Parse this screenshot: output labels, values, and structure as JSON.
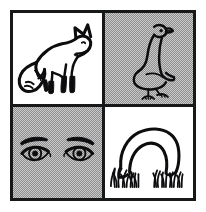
{
  "figure": {
    "kind": "line-art-panel-grid",
    "panel_count": 4,
    "columns": 2,
    "rows": 2,
    "outer_background": "#ffffff",
    "frame_color": "#17181a",
    "frame_thickness_px": 3,
    "ink_color": "#0d0d0f",
    "grey_fill": "#aeaeae",
    "white_fill": "#ffffff",
    "grey_fill_style": "halftone-dither-checkerboard"
  },
  "panels": [
    {
      "position": "top-left",
      "subject": "fox",
      "subject_label": "Fox",
      "description": "Standing fox in profile facing right with a large bushy white-tipped tail sweeping to the left, pointed ears, and dark lower legs.",
      "background": "white",
      "background_color": "#ffffff",
      "facing": "right",
      "has_grass": false
    },
    {
      "position": "top-right",
      "subject": "goose",
      "subject_label": "Goose",
      "description": "Standing goose in profile with a long S-curved neck, head turned to the right, plump body and two webbed feet.",
      "background": "grey",
      "background_color": "#aeaeae",
      "facing": "right",
      "has_grass": false
    },
    {
      "position": "bottom-left",
      "subject": "eyes",
      "subject_label": "Eyes",
      "description": "A pair of human eyes seen frontally, almond shaped with round irises and pupils, each topped by a thick arched eyebrow.",
      "background": "grey",
      "background_color": "#aeaeae",
      "facing": "forward",
      "has_grass": false
    },
    {
      "position": "bottom-right",
      "subject": "grazing-sheep",
      "subject_label": "Grazing sheep",
      "description": "A sheep with a strongly arched back and its head lowered into tufts of grass, grazing.",
      "background": "white",
      "background_color": "#ffffff",
      "facing": "right",
      "has_grass": true
    }
  ]
}
